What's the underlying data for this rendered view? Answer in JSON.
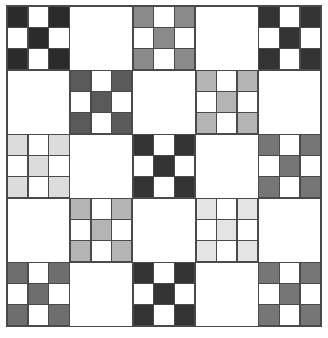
{
  "artwork": {
    "title": "Nine-Patch Checkerboard Quilt",
    "type": "quilt-pattern",
    "grid_rows": 5,
    "grid_cols": 5,
    "background_color": "#ffffff",
    "line_color": "#4a4a4a",
    "border_color": "#4a4a4a"
  },
  "palette": {
    "white": "#ffffff",
    "very_dark": "#2b2b2b",
    "dark": "#333333",
    "dark_gray": "#3a3a3a",
    "medium_dark": "#5a5a5a",
    "medium": "#6e6e6e",
    "medium_gray": "#767676",
    "mid_light": "#8a8a8a",
    "light_medium": "#b4b4b4",
    "light": "#c9c9c9",
    "very_light": "#dcdcdc",
    "palest": "#e4e4e4"
  },
  "blocks": [
    {
      "row": 1,
      "col": 1,
      "style": "ninepatch",
      "color": "#2b2b2b",
      "label": "dark nine-patch"
    },
    {
      "row": 1,
      "col": 2,
      "style": "plain",
      "color": "#ffffff",
      "label": "white block"
    },
    {
      "row": 1,
      "col": 3,
      "style": "ninepatch",
      "color": "#8a8a8a",
      "label": "mid gray nine-patch"
    },
    {
      "row": 1,
      "col": 4,
      "style": "plain",
      "color": "#ffffff",
      "label": "white block"
    },
    {
      "row": 1,
      "col": 5,
      "style": "ninepatch",
      "color": "#333333",
      "label": "dark nine-patch"
    },
    {
      "row": 2,
      "col": 1,
      "style": "plain",
      "color": "#ffffff",
      "label": "white block"
    },
    {
      "row": 2,
      "col": 2,
      "style": "ninepatch",
      "color": "#5a5a5a",
      "label": "medium dark nine-patch"
    },
    {
      "row": 2,
      "col": 3,
      "style": "plain",
      "color": "#ffffff",
      "label": "white block"
    },
    {
      "row": 2,
      "col": 4,
      "style": "ninepatch",
      "color": "#b4b4b4",
      "label": "light gray nine-patch"
    },
    {
      "row": 2,
      "col": 5,
      "style": "plain",
      "color": "#ffffff",
      "label": "white block"
    },
    {
      "row": 3,
      "col": 1,
      "style": "ninepatch",
      "color": "#dcdcdc",
      "label": "very light nine-patch"
    },
    {
      "row": 3,
      "col": 2,
      "style": "plain",
      "color": "#ffffff",
      "label": "white block"
    },
    {
      "row": 3,
      "col": 3,
      "style": "ninepatch",
      "color": "#333333",
      "label": "dark nine-patch"
    },
    {
      "row": 3,
      "col": 4,
      "style": "plain",
      "color": "#ffffff",
      "label": "white block"
    },
    {
      "row": 3,
      "col": 5,
      "style": "ninepatch",
      "color": "#767676",
      "label": "medium gray nine-patch"
    },
    {
      "row": 4,
      "col": 1,
      "style": "plain",
      "color": "#ffffff",
      "label": "white block"
    },
    {
      "row": 4,
      "col": 2,
      "style": "ninepatch",
      "color": "#b4b4b4",
      "label": "light gray nine-patch"
    },
    {
      "row": 4,
      "col": 3,
      "style": "plain",
      "color": "#ffffff",
      "label": "white block"
    },
    {
      "row": 4,
      "col": 4,
      "style": "ninepatch",
      "color": "#e4e4e4",
      "label": "palest nine-patch"
    },
    {
      "row": 4,
      "col": 5,
      "style": "plain",
      "color": "#ffffff",
      "label": "white block"
    },
    {
      "row": 5,
      "col": 1,
      "style": "ninepatch",
      "color": "#6e6e6e",
      "label": "medium gray nine-patch"
    },
    {
      "row": 5,
      "col": 2,
      "style": "plain",
      "color": "#ffffff",
      "label": "white block"
    },
    {
      "row": 5,
      "col": 3,
      "style": "ninepatch",
      "color": "#333333",
      "label": "dark nine-patch"
    },
    {
      "row": 5,
      "col": 4,
      "style": "plain",
      "color": "#ffffff",
      "label": "white block"
    },
    {
      "row": 5,
      "col": 5,
      "style": "ninepatch",
      "color": "#767676",
      "label": "medium gray nine-patch"
    }
  ],
  "ninepatch_layout": {
    "description": "3x3 sub-grid; filled cells form an X: four corners plus center",
    "cells": [
      1,
      0,
      1,
      0,
      1,
      0,
      1,
      0,
      1
    ]
  }
}
